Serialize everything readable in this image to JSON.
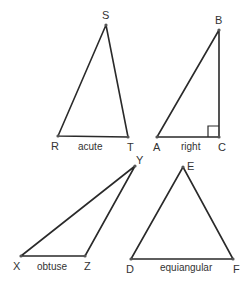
{
  "diagram": {
    "stroke_color": "#2a2a2a",
    "triangles": [
      {
        "type": "acute",
        "caption": "acute",
        "vertices": [
          {
            "label": "R",
            "x": 58,
            "y": 136
          },
          {
            "label": "S",
            "x": 106,
            "y": 25
          },
          {
            "label": "T",
            "x": 128,
            "y": 137
          }
        ]
      },
      {
        "type": "right",
        "caption": "right",
        "vertices": [
          {
            "label": "A",
            "x": 157,
            "y": 137
          },
          {
            "label": "B",
            "x": 219,
            "y": 30
          },
          {
            "label": "C",
            "x": 219,
            "y": 137
          }
        ],
        "right_angle_at": "C"
      },
      {
        "type": "obtuse",
        "caption": "obtuse",
        "vertices": [
          {
            "label": "X",
            "x": 21,
            "y": 256
          },
          {
            "label": "Y",
            "x": 135,
            "y": 166
          },
          {
            "label": "Z",
            "x": 85,
            "y": 256
          }
        ]
      },
      {
        "type": "equiangular",
        "caption": "equiangular",
        "vertices": [
          {
            "label": "D",
            "x": 131,
            "y": 259
          },
          {
            "label": "E",
            "x": 183,
            "y": 167
          },
          {
            "label": "F",
            "x": 233,
            "y": 259
          }
        ]
      }
    ]
  }
}
